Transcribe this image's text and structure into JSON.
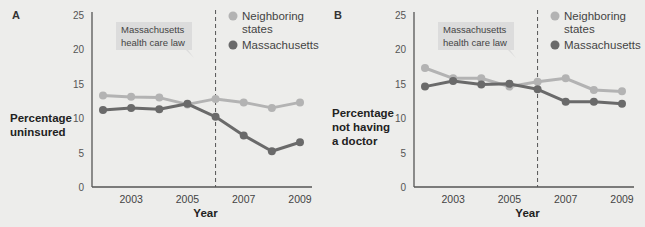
{
  "colors": {
    "neighboring": "#b3b3b3",
    "massachusetts": "#6a6a6a",
    "axis": "#555555",
    "annotation_bg": "#dcdcdc",
    "text": "#333333"
  },
  "chart_data": [
    {
      "panel": "A",
      "type": "line",
      "title": "",
      "xlabel": "Year",
      "ylabel": "Percentage uninsured",
      "ylabel_lines": [
        "Percentage",
        "uninsured"
      ],
      "x": [
        2002,
        2003,
        2004,
        2005,
        2006,
        2007,
        2008,
        2009
      ],
      "xticks": [
        "2003",
        "2005",
        "2007",
        "2009"
      ],
      "yticks": [
        "0",
        "5",
        "10",
        "15",
        "20",
        "25"
      ],
      "ylim": [
        0,
        25
      ],
      "grid": false,
      "annotation": {
        "lines": [
          "Massachusetts",
          "health care law"
        ],
        "x": 2006
      },
      "legend": [
        "Neighboring states",
        "Massachusetts"
      ],
      "series": [
        {
          "name": "Neighboring states",
          "values": [
            13.3,
            13.1,
            13.0,
            12.0,
            12.8,
            12.3,
            11.5,
            12.3
          ]
        },
        {
          "name": "Massachusetts",
          "values": [
            11.2,
            11.5,
            11.3,
            12.1,
            10.2,
            7.5,
            5.2,
            6.5
          ]
        }
      ]
    },
    {
      "panel": "B",
      "type": "line",
      "title": "",
      "xlabel": "Year",
      "ylabel": "Percentage not having a doctor",
      "ylabel_lines": [
        "Percentage",
        "not having",
        "a doctor"
      ],
      "x": [
        2002,
        2003,
        2004,
        2005,
        2006,
        2007,
        2008,
        2009
      ],
      "xticks": [
        "2003",
        "2005",
        "2007",
        "2009"
      ],
      "yticks": [
        "0",
        "5",
        "10",
        "15",
        "20",
        "25"
      ],
      "ylim": [
        0,
        25
      ],
      "grid": false,
      "annotation": {
        "lines": [
          "Massachusetts",
          "health care law"
        ],
        "x": 2006
      },
      "legend": [
        "Neighboring states",
        "Massachusetts"
      ],
      "series": [
        {
          "name": "Neighboring states",
          "values": [
            17.3,
            15.8,
            15.8,
            14.6,
            15.3,
            15.8,
            14.1,
            13.9
          ]
        },
        {
          "name": "Massachusetts",
          "values": [
            14.6,
            15.4,
            14.9,
            15.0,
            14.2,
            12.4,
            12.4,
            12.1
          ]
        }
      ]
    }
  ]
}
